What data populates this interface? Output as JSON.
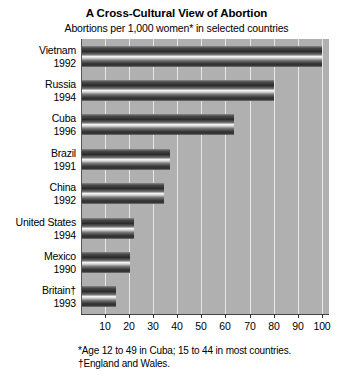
{
  "chart_data": {
    "type": "bar",
    "orientation": "horizontal",
    "title": "A Cross-Cultural View of Abortion",
    "subtitle": "Abortions per 1,000 women* in selected countries",
    "xlabel": "",
    "ylabel": "",
    "xlim": [
      0,
      103
    ],
    "grid": true,
    "legend": null,
    "xticks": [
      10,
      20,
      30,
      40,
      50,
      60,
      70,
      80,
      90,
      100
    ],
    "xticklabels": [
      "10",
      "20",
      "30",
      "40",
      "50",
      "60",
      "70",
      "80",
      "90",
      "100"
    ],
    "categories": [
      "Vietnam 1992",
      "Russia 1994",
      "Cuba 1996",
      "Brazil 1991",
      "China 1992",
      "United States 1994",
      "Mexico 1990",
      "Britain† 1993"
    ],
    "values": [
      100,
      80,
      63.5,
      37,
      34.5,
      22,
      20.5,
      14.5
    ],
    "bars": [
      {
        "country": "Vietnam",
        "year": "1992",
        "value": 100
      },
      {
        "country": "Russia",
        "year": "1994",
        "value": 80
      },
      {
        "country": "Cuba",
        "year": "1996",
        "value": 63.5
      },
      {
        "country": "Brazil",
        "year": "1991",
        "value": 37
      },
      {
        "country": "China",
        "year": "1992",
        "value": 34.5
      },
      {
        "country": "United States",
        "year": "1994",
        "value": 22
      },
      {
        "country": "Mexico",
        "year": "1990",
        "value": 20.5
      },
      {
        "country": "Britain†",
        "year": "1993",
        "value": 14.5
      }
    ],
    "annotations": [
      "*Age 12 to 49 in Cuba; 15 to 44 in most countries.",
      "†England and Wales."
    ],
    "colors": {
      "plot_background": "#b0b0b0",
      "gridline": "#e8e8e8",
      "bar_dark": "#2a2a2a",
      "bar_highlight": "#f2f2f2",
      "page_background": "#ffffff",
      "text": "#000000"
    }
  },
  "footnotes": {
    "line1": "*Age 12 to 49 in Cuba; 15 to 44 in most countries.",
    "line2": "†England and Wales."
  }
}
